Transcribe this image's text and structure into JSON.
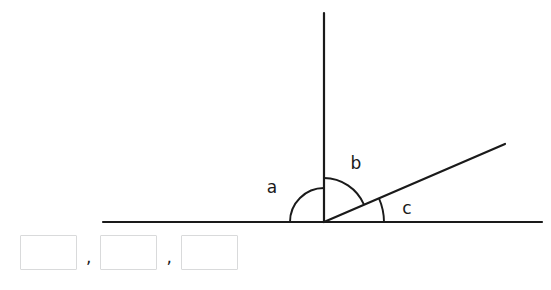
{
  "figure": {
    "stroke_color": "#1a1a1a",
    "background_color": "#ffffff",
    "vertex": {
      "x": 324,
      "y": 222
    },
    "rays": [
      {
        "name": "horizontal-left-ray",
        "x1": 103,
        "y1": 222,
        "x2": 324,
        "y2": 222
      },
      {
        "name": "horizontal-right-ray",
        "x1": 324,
        "y1": 222,
        "x2": 542,
        "y2": 222
      },
      {
        "name": "vertical-ray",
        "x1": 324,
        "y1": 13,
        "x2": 324,
        "y2": 222
      },
      {
        "name": "diagonal-ray",
        "x1": 324,
        "y1": 222,
        "x2": 505,
        "y2": 144
      }
    ],
    "arcs": [
      {
        "name": "arc-a",
        "label": "a",
        "radius": 34,
        "start_deg": 90,
        "end_deg": 180,
        "label_x": 272,
        "label_y": 188
      },
      {
        "name": "arc-b",
        "label": "b",
        "radius": 44,
        "start_deg": 23.3,
        "end_deg": 90,
        "label_x": 356,
        "label_y": 164
      },
      {
        "name": "arc-c",
        "label": "c",
        "radius": 60,
        "start_deg": 0,
        "end_deg": 23.3,
        "label_x": 407,
        "label_y": 209
      }
    ]
  },
  "answers": {
    "boxes": [
      {
        "name": "answer-box-a",
        "value": "",
        "placeholder": ""
      },
      {
        "name": "answer-box-b",
        "value": "",
        "placeholder": ""
      },
      {
        "name": "answer-box-c",
        "value": "",
        "placeholder": ""
      }
    ],
    "separator": ","
  }
}
